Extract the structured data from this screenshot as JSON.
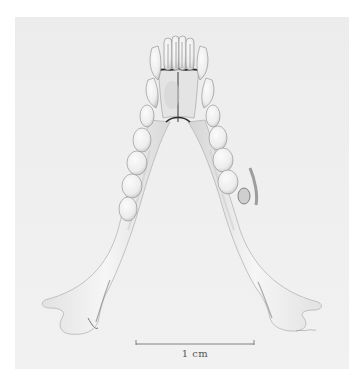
{
  "figure": {
    "colors": {
      "background": "#ffffff",
      "paper": "#eeeeee",
      "bone": "#f4f4f4",
      "shade": "#bdbdbd",
      "ink": "#3a3a3a"
    }
  },
  "scale_bar": {
    "label": "1 cm",
    "x_start": 136,
    "x_end": 254,
    "y": 344
  }
}
